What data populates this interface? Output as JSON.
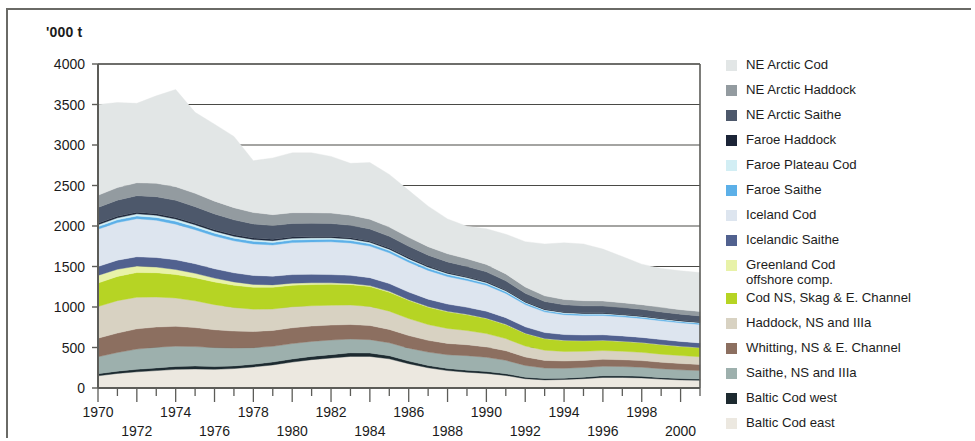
{
  "figure": {
    "unit_label": "'000 t",
    "background_color": "#ffffff",
    "frame_color": "#6a6a66"
  },
  "legend": {
    "position": "right",
    "items": [
      {
        "label": "NE Arctic Cod",
        "color": "#e2e6e6"
      },
      {
        "label": "NE Arctic Haddock",
        "color": "#939ba0"
      },
      {
        "label": "NE Arctic Saithe",
        "color": "#4d586b"
      },
      {
        "label": "Faroe Haddock",
        "color": "#1b2437"
      },
      {
        "label": "Faroe Plateau Cod",
        "color": "#d2eef4"
      },
      {
        "label": "Faroe Saithe",
        "color": "#5cb0e8"
      },
      {
        "label": "Iceland Cod",
        "color": "#dde5ef"
      },
      {
        "label": "Icelandic Saithe",
        "color": "#51618f"
      },
      {
        "label": "Greenland Cod\noffshore comp.",
        "color": "#e8f2a8"
      },
      {
        "label": "Cod NS, Skag & E. Channel",
        "color": "#b6d424"
      },
      {
        "label": "Haddock, NS and IIIa",
        "color": "#d8d2c2"
      },
      {
        "label": "Whitting, NS & E. Channel",
        "color": "#8c6f60"
      },
      {
        "label": "Saithe, NS and IIIa",
        "color": "#9db0ad"
      },
      {
        "label": "Baltic Cod west",
        "color": "#1d2a30"
      },
      {
        "label": "Baltic Cod east",
        "color": "#ece8e0"
      }
    ]
  },
  "chart_data": {
    "type": "area",
    "stacked": true,
    "title": "",
    "xlabel": "",
    "ylabel": "'000 t",
    "ylim": [
      0,
      4000
    ],
    "xlim": [
      1970,
      2001
    ],
    "grid": true,
    "y_ticks": [
      0,
      500,
      1000,
      1500,
      2000,
      2500,
      3000,
      3500,
      4000
    ],
    "x_ticks": [
      1970,
      1971,
      1972,
      1973,
      1974,
      1975,
      1976,
      1977,
      1978,
      1979,
      1980,
      1981,
      1982,
      1983,
      1984,
      1985,
      1986,
      1987,
      1988,
      1989,
      1990,
      1991,
      1992,
      1993,
      1994,
      1995,
      1996,
      1997,
      1998,
      1999,
      2000,
      2001
    ],
    "x_tick_labels_top": [
      1970,
      1974,
      1978,
      1982,
      1986,
      1990,
      1994,
      1998
    ],
    "x_tick_labels_bottom": [
      1972,
      1976,
      1980,
      1984,
      1988,
      1992,
      1996,
      2000
    ],
    "x": [
      1970,
      1971,
      1972,
      1973,
      1974,
      1975,
      1976,
      1977,
      1978,
      1979,
      1980,
      1981,
      1982,
      1983,
      1984,
      1985,
      1986,
      1987,
      1988,
      1989,
      1990,
      1991,
      1992,
      1993,
      1994,
      1995,
      1996,
      1997,
      1998,
      1999,
      2000,
      2001
    ],
    "stack_order_bottom_to_top": [
      "Baltic Cod east",
      "Baltic Cod west",
      "Saithe, NS and IIIa",
      "Whitting, NS & E. Channel",
      "Haddock, NS and IIIa",
      "Cod NS, Skag & E. Channel",
      "Greenland Cod offshore comp.",
      "Icelandic Saithe",
      "Iceland Cod",
      "Faroe Saithe",
      "Faroe Plateau Cod",
      "Faroe Haddock",
      "NE Arctic Saithe",
      "NE Arctic Haddock",
      "NE Arctic Cod"
    ],
    "series": [
      {
        "name": "Baltic Cod east",
        "color": "#ece8e0",
        "values": [
          150,
          180,
          200,
          215,
          230,
          235,
          230,
          240,
          260,
          285,
          320,
          350,
          370,
          390,
          390,
          360,
          300,
          250,
          215,
          195,
          180,
          155,
          115,
          100,
          105,
          115,
          130,
          130,
          125,
          110,
          100,
          95
        ]
      },
      {
        "name": "Baltic Cod west",
        "color": "#1d2a30",
        "values": [
          25,
          28,
          30,
          33,
          36,
          36,
          34,
          33,
          33,
          35,
          38,
          40,
          42,
          44,
          42,
          38,
          32,
          28,
          25,
          24,
          24,
          22,
          18,
          16,
          16,
          18,
          20,
          20,
          19,
          18,
          16,
          15
        ]
      },
      {
        "name": "Saithe, NS and IIIa",
        "color": "#9db0ad",
        "values": [
          210,
          230,
          250,
          255,
          250,
          240,
          235,
          220,
          205,
          195,
          190,
          185,
          180,
          170,
          165,
          160,
          160,
          165,
          170,
          180,
          175,
          165,
          145,
          130,
          122,
          120,
          118,
          115,
          112,
          110,
          108,
          105
        ]
      },
      {
        "name": "Whitting, NS & E. Channel",
        "color": "#8c6f60",
        "values": [
          230,
          240,
          250,
          250,
          245,
          235,
          220,
          210,
          200,
          195,
          195,
          190,
          185,
          180,
          175,
          165,
          155,
          145,
          140,
          135,
          128,
          118,
          105,
          95,
          90,
          88,
          86,
          84,
          82,
          80,
          78,
          76
        ]
      },
      {
        "name": "Haddock, NS and IIIa",
        "color": "#d8d2c2",
        "values": [
          390,
          400,
          390,
          370,
          350,
          330,
          310,
          290,
          275,
          265,
          260,
          250,
          245,
          240,
          235,
          225,
          210,
          195,
          185,
          175,
          165,
          150,
          135,
          125,
          118,
          112,
          108,
          105,
          102,
          100,
          98,
          95
        ]
      },
      {
        "name": "Cod NS, Skag & E. Channel",
        "color": "#b6d424",
        "values": [
          290,
          300,
          305,
          300,
          290,
          285,
          280,
          275,
          270,
          268,
          265,
          262,
          258,
          252,
          245,
          235,
          225,
          215,
          205,
          195,
          185,
          172,
          155,
          142,
          134,
          128,
          124,
          120,
          118,
          115,
          112,
          110
        ]
      },
      {
        "name": "Greenland Cod offshore comp.",
        "color": "#e8f2a8",
        "values": [
          95,
          88,
          80,
          70,
          62,
          55,
          48,
          42,
          36,
          30,
          26,
          22,
          18,
          15,
          12,
          10,
          8,
          7,
          6,
          5,
          5,
          4,
          4,
          3,
          3,
          3,
          3,
          3,
          3,
          3,
          3,
          3
        ]
      },
      {
        "name": "Icelandic Saithe",
        "color": "#51618f",
        "values": [
          110,
          112,
          115,
          118,
          120,
          118,
          115,
          112,
          110,
          108,
          106,
          104,
          102,
          100,
          98,
          96,
          94,
          92,
          90,
          88,
          86,
          82,
          78,
          74,
          72,
          70,
          68,
          66,
          64,
          62,
          60,
          58
        ]
      },
      {
        "name": "Iceland Cod",
        "color": "#dde5ef",
        "values": [
          460,
          465,
          470,
          460,
          440,
          420,
          405,
          395,
          390,
          385,
          395,
          400,
          405,
          400,
          390,
          380,
          370,
          355,
          340,
          330,
          320,
          300,
          275,
          255,
          245,
          240,
          238,
          236,
          234,
          232,
          230,
          228
        ]
      },
      {
        "name": "Faroe Saithe",
        "color": "#5cb0e8",
        "values": [
          32,
          33,
          34,
          35,
          36,
          35,
          34,
          33,
          32,
          31,
          31,
          30,
          30,
          29,
          28,
          27,
          26,
          25,
          24,
          23,
          22,
          21,
          19,
          17,
          16,
          16,
          16,
          15,
          15,
          15,
          14,
          14
        ]
      },
      {
        "name": "Faroe Plateau Cod",
        "color": "#d2eef4",
        "values": [
          24,
          25,
          26,
          27,
          27,
          26,
          25,
          24,
          23,
          22,
          22,
          21,
          21,
          20,
          19,
          18,
          17,
          16,
          15,
          14,
          13,
          12,
          11,
          10,
          10,
          10,
          10,
          9,
          9,
          9,
          9,
          9
        ]
      },
      {
        "name": "Faroe Haddock",
        "color": "#1b2437",
        "values": [
          18,
          18,
          19,
          19,
          19,
          18,
          18,
          17,
          17,
          16,
          16,
          15,
          15,
          14,
          14,
          13,
          13,
          12,
          12,
          11,
          11,
          10,
          9,
          9,
          8,
          8,
          8,
          8,
          8,
          7,
          7,
          7
        ]
      },
      {
        "name": "NE Arctic Saithe",
        "color": "#4d586b",
        "values": [
          195,
          200,
          205,
          210,
          212,
          205,
          195,
          185,
          175,
          170,
          168,
          165,
          160,
          155,
          150,
          145,
          140,
          135,
          130,
          125,
          120,
          112,
          100,
          92,
          88,
          86,
          84,
          82,
          80,
          78,
          76,
          75
        ]
      },
      {
        "name": "NE Arctic Haddock",
        "color": "#939ba0",
        "values": [
          150,
          155,
          160,
          165,
          168,
          165,
          158,
          150,
          140,
          135,
          132,
          130,
          128,
          125,
          120,
          115,
          110,
          105,
          100,
          96,
          92,
          85,
          78,
          70,
          66,
          64,
          62,
          60,
          58,
          57,
          56,
          55
        ]
      },
      {
        "name": "NE Arctic Cod",
        "color": "#e2e6e6",
        "values": [
          1120,
          1050,
          980,
          1080,
          1200,
          1000,
          950,
          880,
          640,
          700,
          740,
          740,
          700,
          640,
          700,
          650,
          580,
          500,
          430,
          400,
          440,
          490,
          560,
          640,
          700,
          700,
          640,
          570,
          500,
          480,
          480,
          480
        ]
      }
    ]
  }
}
